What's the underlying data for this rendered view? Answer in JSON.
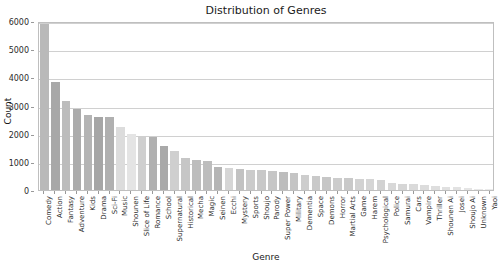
{
  "chart_data": {
    "type": "bar",
    "title": "Distribution of Genres",
    "xlabel": "Genre",
    "ylabel": "Count",
    "ylim": [
      0,
      6000
    ],
    "yticks": [
      0,
      1000,
      2000,
      3000,
      4000,
      5000,
      6000
    ],
    "ytick_labels": [
      "0",
      "1000",
      "2000",
      "3000",
      "4000",
      "5000",
      "6000"
    ],
    "grid": true,
    "legend": "none",
    "categories": [
      "Comedy",
      "Action",
      "Fantasy",
      "Adventure",
      "Kids",
      "Drama",
      "Sci-Fi",
      "Music",
      "Shounen",
      "Slice of Life",
      "Romance",
      "School",
      "Supernatural",
      "Historical",
      "Mecha",
      "Magic",
      "Seinen",
      "Ecchi",
      "Mystery",
      "Sports",
      "Shoujo",
      "Parody",
      "Super Power",
      "Military",
      "Dementia",
      "Space",
      "Demons",
      "Horror",
      "Martial Arts",
      "Game",
      "Harem",
      "Psychological",
      "Police",
      "Samurai",
      "Cars",
      "Vampire",
      "Thriller",
      "Shounen Ai",
      "Josei",
      "Shoujo Ai",
      "Unknown",
      "Yaoi"
    ],
    "values": [
      5900,
      3820,
      3160,
      2860,
      2680,
      2610,
      2590,
      2250,
      2000,
      1930,
      1870,
      1560,
      1400,
      1120,
      1080,
      1020,
      830,
      780,
      740,
      720,
      700,
      660,
      640,
      600,
      520,
      500,
      470,
      440,
      420,
      400,
      380,
      360,
      260,
      230,
      200,
      170,
      150,
      120,
      100,
      70,
      50,
      25
    ],
    "bar_colors": [
      "#b9b9b9",
      "#a8a8a8",
      "#bcbcbc",
      "#ababab",
      "#b4b4b4",
      "#a6a6a6",
      "#b0b0b0",
      "#dcdcdc",
      "#e4e4e4",
      "#cfcfcf",
      "#b0b0b0",
      "#a9a9a9",
      "#cfcfcf",
      "#c6c6c6",
      "#bdbdbd",
      "#bdbdbd",
      "#b5b5b5",
      "#d6d6d6",
      "#c2c2c2",
      "#cbcbcb",
      "#c8c8c8",
      "#c6c6c6",
      "#bdbdbd",
      "#c4c4c4",
      "#cdcdcd",
      "#c9c9c9",
      "#c6c6c6",
      "#cccccc",
      "#c9c9c9",
      "#d2d2d2",
      "#d5d5d5",
      "#d2d2d2",
      "#d8d8d8",
      "#d6d6d6",
      "#dadada",
      "#dcdcdc",
      "#dedede",
      "#e0e0e0",
      "#e2e2e2",
      "#e5e5e5",
      "#e8e8e8",
      "#ebebeb"
    ]
  },
  "colors": {
    "axis": "#bfbfbf",
    "grid": "#d0d0d0",
    "text": "#1a1a1a",
    "tick_text": "#2b2b2b",
    "background": "#ffffff"
  }
}
